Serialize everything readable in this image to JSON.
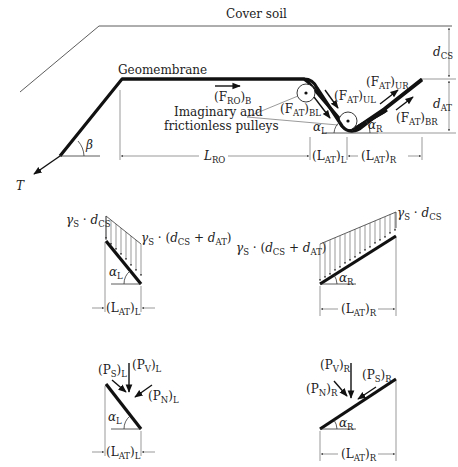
{
  "figure": {
    "top": {
      "cover_soil": "Cover soil",
      "geomembrane": "Geomembrane",
      "beta": "β",
      "tension": "T",
      "f_ro_b": {
        "main": "(F",
        "sub1": "RO",
        "close": ")",
        "sub2": "B"
      },
      "pulleys_line1": "Imaginary and",
      "pulleys_line2": "frictionless pulleys",
      "f_at_bl": {
        "main": "(F",
        "sub1": "AT",
        "close": ")",
        "sub2": "BL"
      },
      "f_at_ul": {
        "main": "(F",
        "sub1": "AT",
        "close": ")",
        "sub2": "UL"
      },
      "f_at_ur": {
        "main": "(F",
        "sub1": "AT",
        "close": ")",
        "sub2": "UR"
      },
      "f_at_br": {
        "main": "(F",
        "sub1": "AT",
        "close": ")",
        "sub2": "BR"
      },
      "alpha_l": {
        "main": "α",
        "sub": "L"
      },
      "alpha_r": {
        "main": "α",
        "sub": "R"
      },
      "d_cs": {
        "main": "d",
        "sub": "CS"
      },
      "d_at": {
        "main": "d",
        "sub": "AT"
      },
      "l_ro": {
        "main": "L",
        "sub": "RO"
      },
      "l_at_l": {
        "main": "(L",
        "sub1": "AT",
        "close": ")",
        "sub2": "L"
      },
      "l_at_r": {
        "main": "(L",
        "sub1": "AT",
        "close": ")",
        "sub2": "R"
      }
    },
    "middle_left": {
      "top_load": {
        "g": "γ",
        "gs": "S",
        "dot": " · ",
        "d": "d",
        "ds": "CS"
      },
      "bottom_load": {
        "g": "γ",
        "gs": "S",
        "dot": " · (",
        "d1": "d",
        "d1s": "CS",
        "plus": " + ",
        "d2": "d",
        "d2s": "AT",
        "close": ")"
      },
      "alpha": {
        "main": "α",
        "sub": "L"
      },
      "length": {
        "main": "(L",
        "sub1": "AT",
        "close": ")",
        "sub2": "L"
      }
    },
    "middle_right": {
      "top_load": {
        "g": "γ",
        "gs": "S",
        "dot": " · ",
        "d": "d",
        "ds": "CS"
      },
      "bottom_load": {
        "g": "γ",
        "gs": "S",
        "dot": " · (",
        "d1": "d",
        "d1s": "CS",
        "plus": " + ",
        "d2": "d",
        "d2s": "AT",
        "close": ")"
      },
      "alpha": {
        "main": "α",
        "sub": "R"
      },
      "length": {
        "main": "(L",
        "sub1": "AT",
        "close": ")",
        "sub2": "R"
      }
    },
    "bottom_left": {
      "p_s": {
        "main": "(P",
        "sub1": "S",
        "close": ")",
        "sub2": "L"
      },
      "p_v": {
        "main": "(P",
        "sub1": "V",
        "close": ")",
        "sub2": "L"
      },
      "p_n": {
        "main": "(P",
        "sub1": "N",
        "close": ")",
        "sub2": "L"
      },
      "alpha": {
        "main": "α",
        "sub": "L"
      },
      "length": {
        "main": "(L",
        "sub1": "AT",
        "close": ")",
        "sub2": "L"
      }
    },
    "bottom_right": {
      "p_v": {
        "main": "(P",
        "sub1": "V",
        "close": ")",
        "sub2": "R"
      },
      "p_n": {
        "main": "(P",
        "sub1": "N",
        "close": ")",
        "sub2": "R"
      },
      "p_s": {
        "main": "(P",
        "sub1": "S",
        "close": ")",
        "sub2": "R"
      },
      "alpha": {
        "main": "α",
        "sub": "R"
      },
      "length": {
        "main": "(L",
        "sub1": "AT",
        "close": ")",
        "sub2": "R"
      }
    }
  }
}
